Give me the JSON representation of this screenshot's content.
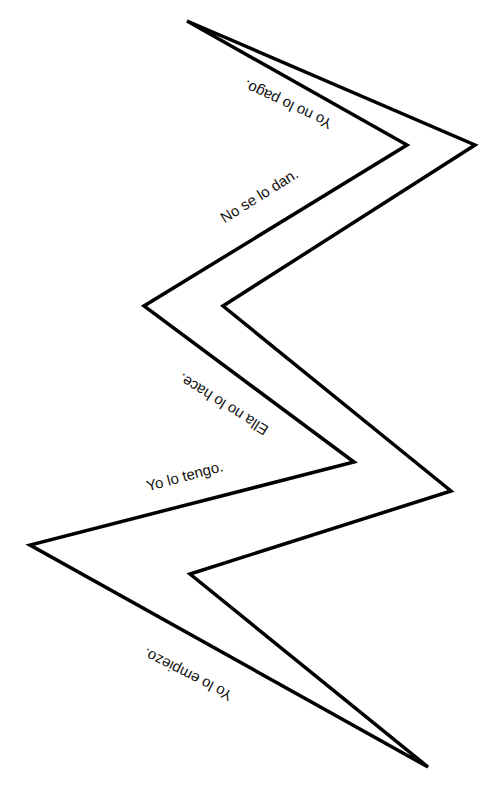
{
  "diagram": {
    "type": "zigzag-lightning-bolt",
    "stroke_color": "#000000",
    "fill_color": "#ffffff",
    "outline_points": "187,21 475,145 223,306 451,491 190,574 428,767 30,545 354,462 144,306 407,145",
    "sentences": [
      {
        "text": "Yo no lo pago.",
        "x": 290,
        "y": 100,
        "angle": 205
      },
      {
        "text": "No se lo dan.",
        "x": 262,
        "y": 200,
        "angle": -32
      },
      {
        "text": "Ella no lo hace.",
        "x": 226,
        "y": 400,
        "angle": 212
      },
      {
        "text": "Yo lo tengo.",
        "x": 186,
        "y": 481,
        "angle": -15
      },
      {
        "text": "Yo lo empiezo.",
        "x": 190,
        "y": 670,
        "angle": 207
      }
    ]
  }
}
